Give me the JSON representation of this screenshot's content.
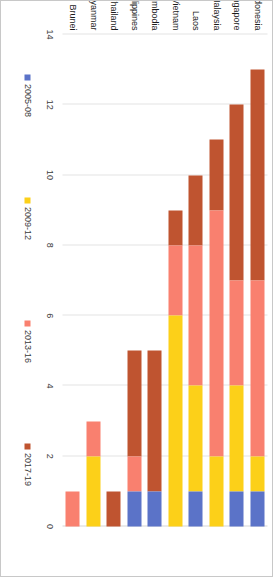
{
  "figure": {
    "orientation": "rotated-90-clockwise",
    "background_color": "#ffffff",
    "frame_color": "#c8c8c8",
    "gridline_color": "#e4e4e4"
  },
  "chart_data": {
    "type": "bar",
    "subtype": "stacked-horizontal",
    "title": "",
    "subtitle": "",
    "xlabel": "",
    "ylabel": "",
    "xlim": [
      0,
      14
    ],
    "grid": true,
    "legend_position": "bottom",
    "tick_labels": [
      "0",
      "2",
      "4",
      "6",
      "8",
      "10",
      "12",
      "14"
    ],
    "tick_values": [
      0,
      2,
      4,
      6,
      8,
      10,
      12,
      14
    ],
    "categories": [
      "Indonesia",
      "Singapore",
      "Malaysia",
      "Laos",
      "Vietnam",
      "Cambodia",
      "Philippines",
      "Thailand",
      "Myanmar",
      "Brunei"
    ],
    "series": [
      {
        "name": "2005-08",
        "color": "#5b73c8",
        "values": [
          1,
          1,
          0,
          1,
          0,
          1,
          1,
          0,
          0,
          0
        ]
      },
      {
        "name": "2009-12",
        "color": "#fcd019",
        "values": [
          1,
          3,
          2,
          3,
          6,
          0,
          0,
          0,
          2,
          0
        ]
      },
      {
        "name": "2013-16",
        "color": "#f9806f",
        "values": [
          5,
          3,
          7,
          4,
          2,
          0,
          1,
          0,
          1,
          1
        ]
      },
      {
        "name": "2017-19",
        "color": "#bf5430",
        "values": [
          6,
          5,
          2,
          2,
          1,
          4,
          3,
          1,
          0,
          0
        ]
      }
    ],
    "totals": [
      13,
      12,
      11,
      10,
      9,
      5,
      5,
      1,
      3,
      1
    ]
  },
  "legend": {
    "entries": [
      {
        "label": "2005-08",
        "color": "#5b73c8"
      },
      {
        "label": "2009-12",
        "color": "#fcd019"
      },
      {
        "label": "2013-16",
        "color": "#f9806f"
      },
      {
        "label": "2017-19",
        "color": "#bf5430"
      }
    ]
  }
}
